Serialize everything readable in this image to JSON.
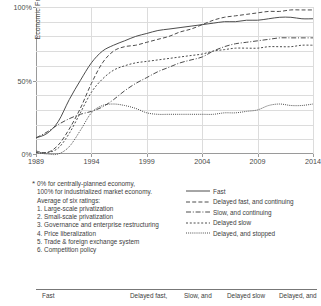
{
  "chart_data": {
    "type": "line",
    "title": "",
    "xlabel": "",
    "ylabel": "Economic Freedom*",
    "xlim": [
      1989,
      2014
    ],
    "ylim": [
      0,
      100
    ],
    "grid": true,
    "legend_position": "bottom-right",
    "x_ticks": [
      "1989",
      "1994",
      "1999",
      "2004",
      "2009",
      "2014"
    ],
    "y_ticks": [
      "0%",
      "50%",
      "100%"
    ],
    "x": [
      1989,
      1990,
      1991,
      1992,
      1993,
      1994,
      1995,
      1996,
      1997,
      1998,
      1999,
      2000,
      2001,
      2002,
      2003,
      2004,
      2005,
      2006,
      2007,
      2008,
      2009,
      2010,
      2011,
      2012,
      2013,
      2014
    ],
    "series": [
      {
        "name": "Fast",
        "style": "solid",
        "values": [
          11,
          14,
          22,
          37,
          50,
          62,
          70,
          74,
          77,
          80,
          82,
          84,
          85,
          86,
          87,
          88,
          89,
          90,
          90,
          91,
          91,
          92,
          93,
          93,
          92,
          92
        ]
      },
      {
        "name": "Delayed fast, and continuing",
        "style": "dashed",
        "values": [
          2,
          1,
          6,
          17,
          31,
          48,
          62,
          70,
          73,
          74,
          76,
          78,
          80,
          83,
          85,
          88,
          91,
          93,
          94,
          95,
          96,
          97,
          97,
          98,
          98,
          98
        ]
      },
      {
        "name": "Slow, and continuing",
        "style": "dash-dot",
        "values": [
          11,
          15,
          20,
          24,
          27,
          29,
          32,
          37,
          43,
          48,
          52,
          56,
          59,
          62,
          64,
          66,
          70,
          73,
          75,
          76,
          77,
          78,
          79,
          79,
          79,
          79
        ]
      },
      {
        "name": "Delayed slow",
        "style": "short-dashed",
        "values": [
          1,
          1,
          4,
          14,
          28,
          42,
          51,
          57,
          60,
          62,
          63,
          64,
          65,
          66,
          67,
          68,
          70,
          71,
          72,
          72,
          72,
          73,
          73,
          73,
          74,
          74
        ]
      },
      {
        "name": "Delayed, and stopped",
        "style": "dotted",
        "values": [
          1,
          0,
          0,
          5,
          16,
          28,
          33,
          34,
          33,
          31,
          28,
          27,
          27,
          27,
          27,
          27,
          27,
          28,
          28,
          29,
          30,
          33,
          34,
          33,
          33,
          34
        ]
      }
    ]
  },
  "axis": {
    "y_label": "Economic Freedom*",
    "y_ticks": [
      "100%",
      "50%",
      "0%"
    ],
    "x_ticks": [
      "1989",
      "1994",
      "1999",
      "2004",
      "2009",
      "2014"
    ]
  },
  "footnote": {
    "marker": "*",
    "lines": [
      "0% for centrally-planned economy,",
      "100% for industrialized market economy.",
      "Average of six ratings:",
      "1. Large-scale privatization",
      "2. Small-scale privatization",
      "3. Governance and enterprise restructuring",
      "4. Price liberalization",
      "5. Trade & foreign exchange system",
      "6. Competition policy"
    ]
  },
  "legend": {
    "items": [
      {
        "label": "Fast",
        "style": "solid"
      },
      {
        "label": "Delayed fast, and continuing",
        "style": "dashed"
      },
      {
        "label": "Slow, and continuing",
        "style": "dash-dot"
      },
      {
        "label": "Delayed slow",
        "style": "short-dashed"
      },
      {
        "label": "Delayed, and stopped",
        "style": "dotted"
      }
    ]
  },
  "bottom_table": {
    "headers": [
      "Fast",
      "Delayed fast,",
      "Slow, and",
      "Delayed slow",
      "Delayed, and"
    ]
  }
}
